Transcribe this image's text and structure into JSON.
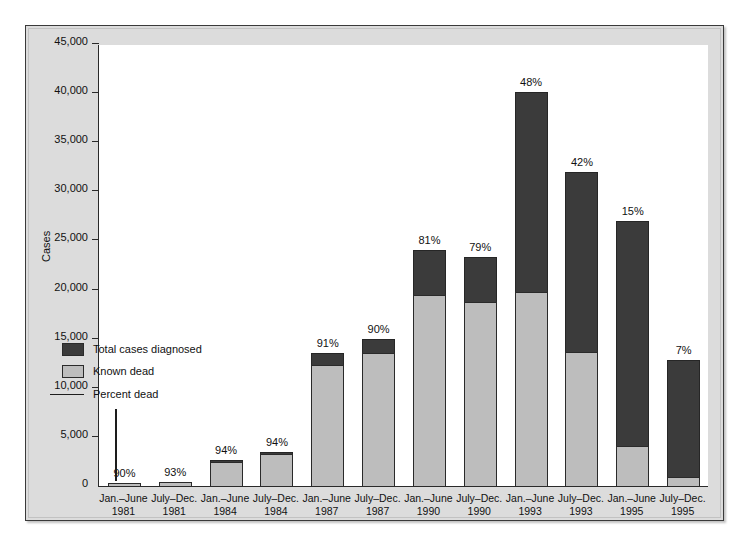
{
  "chart_data": {
    "type": "bar",
    "subtype": "stacked-vertical",
    "title": "",
    "xlabel": "",
    "ylabel": "Cases",
    "ylim": [
      0,
      45000
    ],
    "yticks": [
      "0",
      "5,000",
      "10,000",
      "15,000",
      "20,000",
      "25,000",
      "30,000",
      "35,000",
      "40,000",
      "45,000"
    ],
    "ytick_values": [
      0,
      5000,
      10000,
      15000,
      20000,
      25000,
      30000,
      35000,
      40000,
      45000
    ],
    "grid": false,
    "legend_position": "inside-left",
    "legend": [
      {
        "key": "total",
        "label": "Total cases diagnosed",
        "color": "#3b3b3b",
        "marker": "square"
      },
      {
        "key": "dead",
        "label": "Known dead",
        "color": "#bdbdbd",
        "marker": "square"
      },
      {
        "key": "percent",
        "label": "Percent dead",
        "color": "#1d1d1d",
        "marker": "line"
      }
    ],
    "categories": [
      "Jan.–June\n1981",
      "July–Dec.\n1981",
      "Jan.–June\n1984",
      "July–Dec.\n1984",
      "Jan.–June\n1987",
      "July–Dec.\n1987",
      "Jan.–June\n1990",
      "July–Dec.\n1990",
      "Jan.–June\n1993",
      "July–Dec.\n1993",
      "Jan.–June\n1995",
      "July–Dec.\n1995"
    ],
    "series": [
      {
        "name": "Total cases diagnosed",
        "color": "#3b3b3b",
        "values": [
          320,
          420,
          2600,
          3500,
          13500,
          15000,
          24000,
          23300,
          40100,
          32000,
          27000,
          12800
        ]
      },
      {
        "name": "Known dead",
        "color": "#bdbdbd",
        "values": [
          290,
          390,
          2450,
          3300,
          12300,
          13500,
          19400,
          18700,
          19800,
          13600,
          4100,
          900
        ]
      }
    ],
    "percent_labels": [
      "90%",
      "93%",
      "94%",
      "94%",
      "91%",
      "90%",
      "81%",
      "79%",
      "48%",
      "42%",
      "15%",
      "7%"
    ],
    "percent_values": [
      90,
      93,
      94,
      94,
      91,
      90,
      81,
      79,
      48,
      42,
      15,
      7
    ],
    "bars": [
      {
        "period": "Jan.–June",
        "year": "1981",
        "line1": "Jan.–June",
        "line2": "1981",
        "total": 320,
        "dead": 290,
        "percent": "90%"
      },
      {
        "period": "July–Dec.",
        "year": "1981",
        "line1": "July–Dec.",
        "line2": "1981",
        "total": 420,
        "dead": 390,
        "percent": "93%"
      },
      {
        "period": "Jan.–June",
        "year": "1984",
        "line1": "Jan.–June",
        "line2": "1984",
        "total": 2600,
        "dead": 2450,
        "percent": "94%"
      },
      {
        "period": "July–Dec.",
        "year": "1984",
        "line1": "July–Dec.",
        "line2": "1984",
        "total": 3500,
        "dead": 3300,
        "percent": "94%"
      },
      {
        "period": "Jan.–June",
        "year": "1987",
        "line1": "Jan.–June",
        "line2": "1987",
        "total": 13500,
        "dead": 12300,
        "percent": "91%"
      },
      {
        "period": "July–Dec.",
        "year": "1987",
        "line1": "July–Dec.",
        "line2": "1987",
        "total": 15000,
        "dead": 13500,
        "percent": "90%"
      },
      {
        "period": "Jan.–June",
        "year": "1990",
        "line1": "Jan.–June",
        "line2": "1990",
        "total": 24000,
        "dead": 19400,
        "percent": "81%"
      },
      {
        "period": "July–Dec.",
        "year": "1990",
        "line1": "July–Dec.",
        "line2": "1990",
        "total": 23300,
        "dead": 18700,
        "percent": "79%"
      },
      {
        "period": "Jan.–June",
        "year": "1993",
        "line1": "Jan.–June",
        "line2": "1993",
        "total": 40100,
        "dead": 19800,
        "percent": "48%"
      },
      {
        "period": "July–Dec.",
        "year": "1993",
        "line1": "July–Dec.",
        "line2": "1993",
        "total": 32000,
        "dead": 13600,
        "percent": "42%"
      },
      {
        "period": "Jan.–June",
        "year": "1995",
        "line1": "Jan.–June",
        "line2": "1995",
        "total": 27000,
        "dead": 4100,
        "percent": "15%"
      },
      {
        "period": "July–Dec.",
        "year": "1995",
        "line1": "July–Dec.",
        "line2": "1995",
        "total": 12800,
        "dead": 900,
        "percent": "7%"
      }
    ],
    "colors": {
      "total_cases": "#3b3b3b",
      "known_dead": "#bdbdbd",
      "percent_dead_line": "#1d1d1d",
      "plot_background": "#ffffff",
      "figure_background": "#dcdcdc",
      "axis": "#2a2a2a"
    }
  }
}
